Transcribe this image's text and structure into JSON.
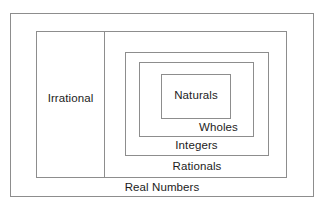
{
  "diagram": {
    "type": "nested-set-venn",
    "background_color": "#ffffff",
    "line_color": "#8d8d8d",
    "text_color": "#1c1c1c",
    "sets": [
      {
        "id": "real",
        "label": "Real Numbers",
        "level": 0,
        "contains": [
          "irrational",
          "rationals"
        ],
        "label_position": "bottom-center"
      },
      {
        "id": "irrational",
        "label": "Irrational",
        "level": 1,
        "contains": [],
        "label_position": "middle-center"
      },
      {
        "id": "rationals",
        "label": "Rationals",
        "level": 1,
        "contains": [
          "integers"
        ],
        "label_position": "bottom-center"
      },
      {
        "id": "integers",
        "label": "Integers",
        "level": 2,
        "contains": [
          "wholes"
        ],
        "label_position": "bottom-center"
      },
      {
        "id": "wholes",
        "label": "Wholes",
        "level": 3,
        "contains": [
          "naturals"
        ],
        "label_position": "bottom-center"
      },
      {
        "id": "naturals",
        "label": "Naturals",
        "level": 4,
        "contains": [],
        "label_position": "middle-center"
      }
    ]
  }
}
